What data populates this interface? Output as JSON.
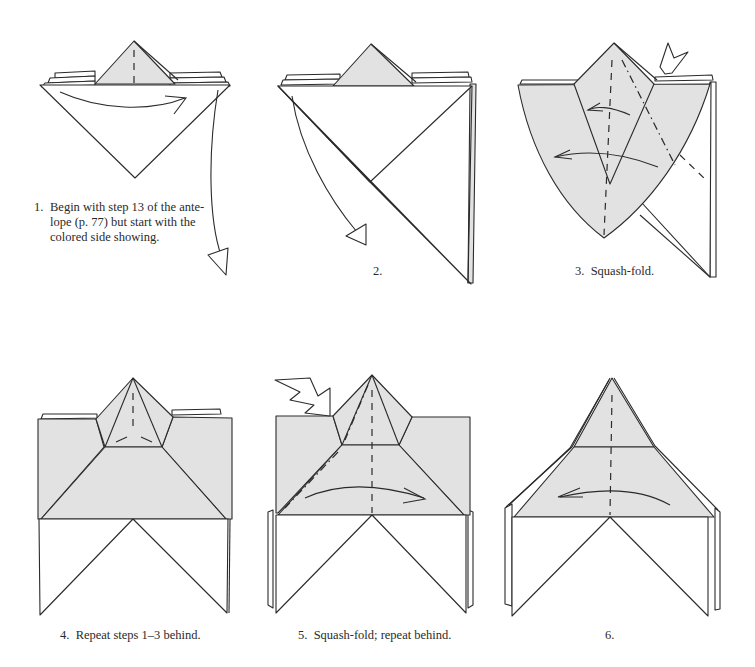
{
  "colors": {
    "paper_colored": "#e2e2e2",
    "paper_white": "#ffffff",
    "line": "#2b2b2b"
  },
  "steps": [
    {
      "number": "1.",
      "caption": "Begin with step 13 of the ante-lope (p. 77) but start with the colored side showing.",
      "caption_lines": [
        "Begin with step 13 of the ante-",
        "lope (p. 77) but start with the",
        "colored side showing."
      ]
    },
    {
      "number": "2.",
      "caption": ""
    },
    {
      "number": "3.",
      "caption": "Squash-fold."
    },
    {
      "number": "4.",
      "caption": "Repeat steps 1–3 behind."
    },
    {
      "number": "5.",
      "caption": "Squash-fold; repeat behind."
    },
    {
      "number": "6.",
      "caption": ""
    }
  ],
  "symbols": {
    "valley_fold": "dashed-line",
    "mountain_fold": "dash-dot-line",
    "fold_arrow": "curved-arrow",
    "push_arrow": "hollow-push-arrow"
  }
}
